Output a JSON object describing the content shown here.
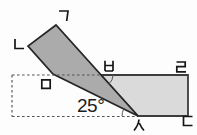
{
  "diagram": {
    "angle_label": "25°",
    "angle_value_degrees": 25,
    "vertex_labels": {
      "flap_top": "ㄱ",
      "flap_left": "ㄴ",
      "strip_bottom_right": "ㄷ",
      "strip_top_right": "ㄹ",
      "flap_bottom_left": "ㅁ",
      "fold_top_intersection": "ㅂ",
      "fold_bottom_point": "ㅅ"
    },
    "colors": {
      "flap_fill": "#ababab",
      "strip_fill": "#dadada",
      "outline": "#2e2e2e",
      "dashed_line": "#555555",
      "background": "#fdfdfd"
    }
  }
}
